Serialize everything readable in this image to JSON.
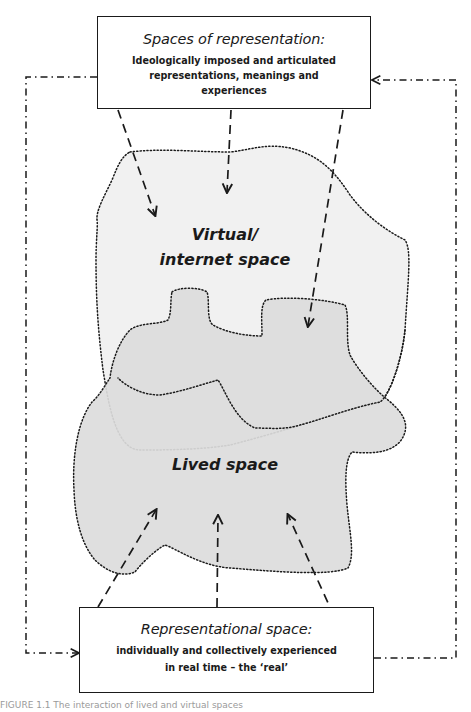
{
  "diagram": {
    "type": "conceptual-diagram",
    "colors": {
      "line": "#1a1a1a",
      "virtual_fill": "#f1f1f1",
      "lived_fill": "#dcdcdc",
      "background": "#ffffff"
    },
    "top_box": {
      "title": "Spaces of representation:",
      "body_lines": [
        "Ideologically imposed and articulated",
        "representations, meanings and",
        "experiences"
      ]
    },
    "bottom_box": {
      "title": "Representational space:",
      "body_lines": [
        "individually and collectively experienced",
        "in real time –  the ‘real’"
      ]
    },
    "regions": {
      "virtual": {
        "label_lines": [
          "Virtual/",
          "internet space"
        ],
        "outline": "dotted"
      },
      "lived": {
        "label_lines": [
          "Lived space"
        ],
        "outline": "dotted"
      }
    },
    "connectors": {
      "top_to_regions": {
        "style": "dashed",
        "count": 3,
        "direction": "down"
      },
      "bottom_to_lived": {
        "style": "dashed",
        "count": 3,
        "direction": "up"
      },
      "left_loop": {
        "style": "dash-dot",
        "from": "top_box",
        "to": "bottom_box"
      },
      "right_loop": {
        "style": "dash-dot",
        "from": "bottom_box",
        "to": "top_box"
      }
    },
    "caption": "FIGURE 1.1  The interaction of lived and virtual spaces"
  }
}
